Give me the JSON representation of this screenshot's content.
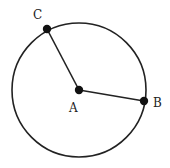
{
  "diagram": {
    "type": "circle-with-radii",
    "circle": {
      "center": "A",
      "cx": 79,
      "cy": 90,
      "r": 67,
      "stroke": "#222222"
    },
    "points": [
      {
        "id": "A",
        "label": "A",
        "x": 79,
        "y": 90,
        "label_x": 69,
        "label_y": 112
      },
      {
        "id": "B",
        "label": "B",
        "x": 144,
        "y": 101,
        "label_x": 153,
        "label_y": 107
      },
      {
        "id": "C",
        "label": "C",
        "x": 47,
        "y": 29,
        "label_x": 33,
        "label_y": 19
      }
    ],
    "segments": [
      {
        "from": "A",
        "to": "C"
      },
      {
        "from": "A",
        "to": "B"
      }
    ]
  }
}
